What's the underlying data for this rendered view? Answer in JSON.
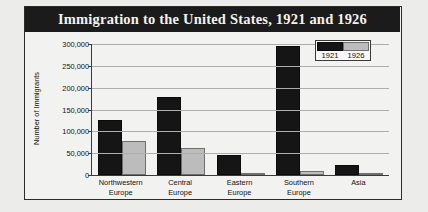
{
  "chart_data": {
    "type": "bar",
    "title": "Immigration to the United States, 1921 and 1926",
    "xlabel": "",
    "ylabel": "Number of Immigrants",
    "categories": [
      "Northwestern Europe",
      "Central Europe",
      "Eastern Europe",
      "Southern Europe",
      "Asia"
    ],
    "category_lines": [
      [
        "Northwestern",
        "Europe"
      ],
      [
        "Central",
        "Europe"
      ],
      [
        "Eastern",
        "Europe"
      ],
      [
        "Southern",
        "Europe"
      ],
      [
        "Asia",
        ""
      ]
    ],
    "series": [
      {
        "name": "1921",
        "color": "#151515",
        "values": [
          127000,
          178000,
          46000,
          295000,
          22000
        ]
      },
      {
        "name": "1926",
        "color": "#bcbcbc",
        "values": [
          77000,
          62000,
          5000,
          10000,
          3000
        ]
      }
    ],
    "ylim": [
      0,
      300000
    ],
    "ytick_values": [
      0,
      50000,
      100000,
      150000,
      200000,
      250000,
      300000
    ],
    "ytick_labels": [
      "0",
      "50,000",
      "100,000",
      "150,000",
      "200,000",
      "250,000",
      "300,000"
    ],
    "grid": true,
    "legend_position": "top-right"
  }
}
